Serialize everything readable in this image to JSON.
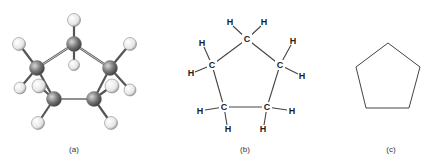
{
  "figure": {
    "panels": [
      {
        "id": "a",
        "label": "(a)",
        "kind": "ball-and-stick model"
      },
      {
        "id": "b",
        "label": "(b)",
        "kind": "structural formula"
      },
      {
        "id": "c",
        "label": "(c)",
        "kind": "skeletal formula"
      }
    ],
    "atoms": {
      "carbon": "C",
      "hydrogen": "H"
    },
    "colors": {
      "carbon": "#6e6e6e",
      "hydrogen": "#eeeeee",
      "bond": "#444444"
    }
  }
}
